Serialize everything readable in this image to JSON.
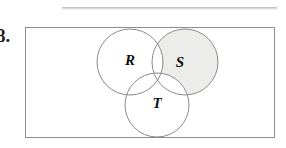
{
  "exercise": {
    "number_label": "8."
  },
  "diagram": {
    "type": "venn-3-set",
    "universe_shape": "rectangle",
    "sets": [
      {
        "id": "R",
        "label": "R",
        "label_x": 105,
        "label_y": 35,
        "cx": 105,
        "cy": 35,
        "r": 33,
        "shaded": false
      },
      {
        "id": "S",
        "label": "S",
        "label_x": 155,
        "label_y": 37,
        "cx": 160,
        "cy": 35,
        "r": 33,
        "shaded": true
      },
      {
        "id": "T",
        "label": "T",
        "label_x": 132,
        "label_y": 78,
        "cx": 132,
        "cy": 78,
        "r": 32,
        "shaded": false
      }
    ],
    "shaded_region_description": "S minus (R union T)",
    "colors": {
      "shade_fill": "#ececea",
      "circle_stroke": "#8a8a8d",
      "rect_stroke": "#8d8d90",
      "label_color": "#101010",
      "page_background": "#ffffff"
    }
  }
}
